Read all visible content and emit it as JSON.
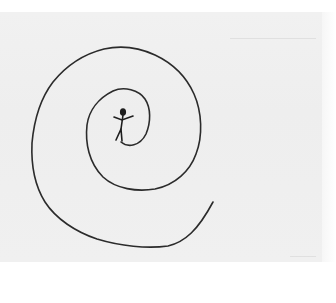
{
  "image": {
    "description": "Hand-drawn pencil sketch on paper: a large spiral line winding outward from a small stick figure at its center",
    "caption": "Spiral with stick figure",
    "colors": {
      "paper": "#efefef",
      "background": "#ffffff",
      "ink": "#2b2b2b"
    },
    "elements": {
      "spiral": {
        "label": "spiral-line",
        "path_points": [
          [
            121,
            142
          ],
          [
            137,
            147
          ],
          [
            148,
            127
          ],
          [
            147,
            102
          ],
          [
            130,
            89
          ],
          [
            107,
            95
          ],
          [
            88,
            120
          ],
          [
            87,
            153
          ],
          [
            103,
            177
          ],
          [
            137,
            190
          ],
          [
            173,
            183
          ],
          [
            195,
            157
          ],
          [
            200,
            117
          ],
          [
            187,
            80
          ],
          [
            160,
            57
          ],
          [
            130,
            47
          ],
          [
            93,
            53
          ],
          [
            60,
            77
          ],
          [
            37,
            117
          ],
          [
            32,
            157
          ],
          [
            43,
            200
          ],
          [
            73,
            227
          ],
          [
            113,
            243
          ],
          [
            163,
            247
          ],
          [
            187,
            237
          ],
          [
            213,
            202
          ]
        ]
      },
      "stick_figure": {
        "label": "stick-figure",
        "position": [
          122,
          125
        ]
      }
    }
  }
}
